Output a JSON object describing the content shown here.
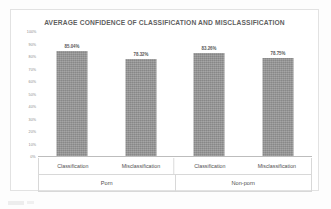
{
  "chart_data": {
    "type": "bar",
    "title": "AVERAGE CONFIDENCE OF CLASSIFICATION AND MISCLASSIFICATION",
    "xlabel": "",
    "ylabel": "",
    "ylim": [
      0,
      100
    ],
    "grid": false,
    "legend": "none",
    "groups": [
      {
        "name": "Porn",
        "categories": [
          "Classification",
          "Misclassification"
        ]
      },
      {
        "name": "Non-porn",
        "categories": [
          "Classification",
          "Misclassification"
        ]
      }
    ],
    "categories": [
      "Classification",
      "Misclassification",
      "Classification",
      "Misclassification"
    ],
    "values": [
      85.04,
      78.32,
      83.26,
      78.75
    ],
    "value_labels": [
      "85.04%",
      "78.32%",
      "83.26%",
      "78.75%"
    ],
    "ytick_labels": [
      "100%",
      "90%",
      "80%",
      "70%",
      "60%",
      "50%",
      "40%",
      "30%",
      "20%",
      "10%",
      "0%"
    ],
    "ytick_values": [
      100,
      90,
      80,
      70,
      60,
      50,
      40,
      30,
      20,
      10,
      0
    ],
    "bar_color": "#939393",
    "axis_color": "#bdbdbd",
    "title_color": "#5f5f5f"
  },
  "bars": [
    {
      "label": "85.04%",
      "category": "Classification",
      "group": "Porn",
      "value": 85.04
    },
    {
      "label": "78.32%",
      "category": "Misclassification",
      "group": "Porn",
      "value": 78.32
    },
    {
      "label": "83.26%",
      "category": "Classification",
      "group": "Non-porn",
      "value": 83.26
    },
    {
      "label": "78.75%",
      "category": "Misclassification",
      "group": "Non-porn",
      "value": 78.75
    }
  ]
}
